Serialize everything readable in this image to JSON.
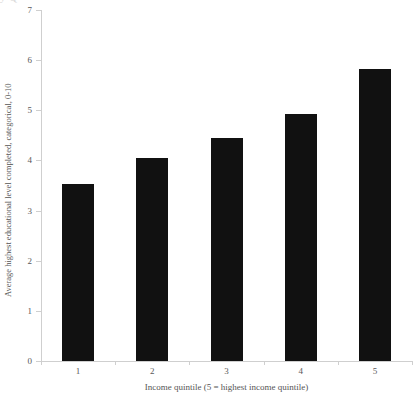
{
  "artifact": {
    "top_fragment_text": "y          Q"
  },
  "chart_data": {
    "type": "bar",
    "title": "",
    "subtitle": "",
    "categories": [
      "1",
      "2",
      "3",
      "4",
      "5"
    ],
    "values": [
      3.52,
      4.04,
      4.44,
      4.92,
      5.82
    ],
    "series": [
      {
        "name": "Average highest educational level completed",
        "values": [
          3.52,
          4.04,
          4.44,
          4.92,
          5.82
        ]
      }
    ],
    "xlabel": "Income quintile (5 = highest income quintile)",
    "ylabel": "Average highest educational level completed, categorical, 0-10",
    "ylim": [
      0,
      7
    ],
    "yticks": [
      0,
      1,
      2,
      3,
      4,
      5,
      6,
      7
    ],
    "ytick_labels": [
      "0",
      "1",
      "2",
      "3",
      "4",
      "5",
      "6",
      "7"
    ],
    "xtick_labels": [
      "1",
      "2",
      "3",
      "4",
      "5"
    ],
    "grid": false,
    "legend": null,
    "legend_position": "none",
    "bar_color": "#111111",
    "axis_color": "#cfcfcf",
    "text_color": "#555555",
    "background_color": "#ffffff"
  }
}
